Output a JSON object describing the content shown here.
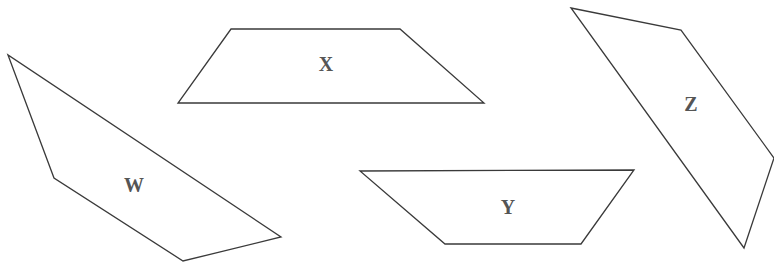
{
  "diagram": {
    "width": 774,
    "height": 262,
    "stroke_color": "#3a3a3a",
    "label_color": "#555555",
    "shapes": [
      {
        "id": "W",
        "label": "W",
        "points": "8,55 54,178 183,261 281,237",
        "label_pos": [
          134,
          187
        ]
      },
      {
        "id": "X",
        "label": "X",
        "points": "231,29 400,29 484,103 178,103",
        "label_pos": [
          326,
          66
        ]
      },
      {
        "id": "Y",
        "label": "Y",
        "points": "360,171 634,170 581,244 445,244",
        "label_pos": [
          508,
          209
        ]
      },
      {
        "id": "Z",
        "label": "Z",
        "points": "571,8 681,30 774,158 744,248",
        "label_pos": [
          691,
          106
        ]
      }
    ]
  }
}
